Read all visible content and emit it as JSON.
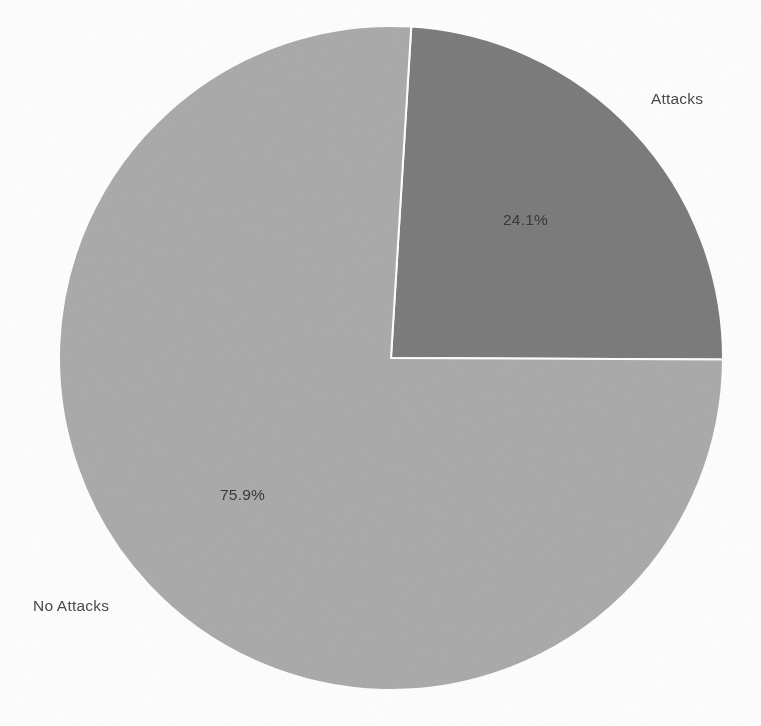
{
  "figure": {
    "background_color": "#ffffff",
    "title_fragment": "",
    "width": 761,
    "height": 726
  },
  "chart_data": {
    "type": "pie",
    "title": "",
    "categories": [
      "Attacks",
      "No Attacks"
    ],
    "values": [
      24.1,
      75.9
    ],
    "value_unit": "percent",
    "labels": [
      "24.1%",
      "75.9%"
    ],
    "colors": [
      "#7d7d7d",
      "#acacac"
    ],
    "legend": "none",
    "start_angle_deg": 3.5,
    "direction": "clockwise",
    "wedge_edge_color": "#ffffff",
    "wedge_edge_width": 2,
    "center": {
      "x": 391,
      "y": 358
    },
    "radius": 332,
    "slices": [
      {
        "name": "Attacks",
        "value": 24.1,
        "pct_label": "24.1%",
        "color": "#7d7d7d",
        "outer_label": "Attacks",
        "pct_label_color": "#3a3a3a",
        "outer_label_color": "#4a4a4a"
      },
      {
        "name": "No Attacks",
        "value": 75.9,
        "pct_label": "75.9%",
        "color": "#acacac",
        "outer_label": "No Attacks",
        "pct_label_color": "#3a3a3a",
        "outer_label_color": "#4a4a4a"
      }
    ]
  }
}
